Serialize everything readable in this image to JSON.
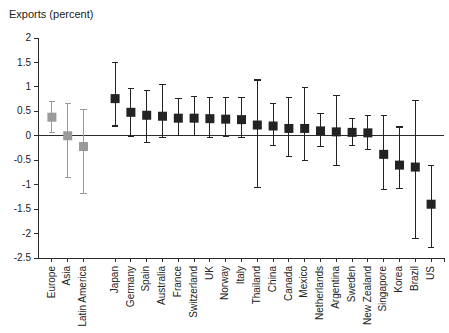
{
  "chart_data": {
    "type": "scatter",
    "title": "Exports (percent)",
    "xlabel": "",
    "ylabel": "",
    "ylim": [
      -2.5,
      2
    ],
    "ytick_labels": [
      "2",
      "1.5",
      "1",
      "0.5",
      "0",
      "-0.5",
      "-1",
      "-1.5",
      "-2",
      "-2.5"
    ],
    "ytick_values": [
      2,
      1.5,
      1,
      0.5,
      0,
      -0.5,
      -1,
      -1.5,
      -2,
      -2.5
    ],
    "grid": false,
    "legend": "none",
    "zero_line": true,
    "categories": [
      "Europe",
      "Asia",
      "Latin America",
      "Japan",
      "Germany",
      "Spain",
      "Australia",
      "France",
      "Switzerland",
      "UK",
      "Norway",
      "Italy",
      "Thailand",
      "China",
      "Canada",
      "Mexico",
      "Netherlands",
      "Argentina",
      "Sweden",
      "New Zealand",
      "Singapore",
      "Korea",
      "Brazil",
      "US"
    ],
    "series": [
      {
        "name": "Region aggregates",
        "color": "#9a9a9a",
        "points": [
          {
            "category": "Europe",
            "value": 0.38,
            "low": 0.06,
            "high": 0.7
          },
          {
            "category": "Asia",
            "value": 0.0,
            "low": -0.86,
            "high": 0.66
          },
          {
            "category": "Latin America",
            "value": -0.22,
            "low": -1.18,
            "high": 0.54
          }
        ]
      },
      {
        "name": "Countries",
        "color": "#232323",
        "points": [
          {
            "category": "Japan",
            "value": 0.76,
            "low": 0.2,
            "high": 1.5
          },
          {
            "category": "Germany",
            "value": 0.48,
            "low": -0.02,
            "high": 0.96
          },
          {
            "category": "Spain",
            "value": 0.42,
            "low": -0.14,
            "high": 0.92
          },
          {
            "category": "Australia",
            "value": 0.4,
            "low": -0.04,
            "high": 1.04
          },
          {
            "category": "France",
            "value": 0.36,
            "low": 0.0,
            "high": 0.76
          },
          {
            "category": "Switzerland",
            "value": 0.36,
            "low": 0.0,
            "high": 0.8
          },
          {
            "category": "UK",
            "value": 0.35,
            "low": -0.04,
            "high": 0.78
          },
          {
            "category": "Norway",
            "value": 0.34,
            "low": -0.02,
            "high": 0.78
          },
          {
            "category": "Italy",
            "value": 0.33,
            "low": -0.04,
            "high": 0.78
          },
          {
            "category": "Thailand",
            "value": 0.22,
            "low": -1.06,
            "high": 1.14
          },
          {
            "category": "China",
            "value": 0.2,
            "low": -0.2,
            "high": 0.66
          },
          {
            "category": "Canada",
            "value": 0.15,
            "low": -0.42,
            "high": 0.78
          },
          {
            "category": "Mexico",
            "value": 0.15,
            "low": -0.5,
            "high": 0.98
          },
          {
            "category": "Netherlands",
            "value": 0.1,
            "low": -0.22,
            "high": 0.46
          },
          {
            "category": "Argentina",
            "value": 0.08,
            "low": -0.6,
            "high": 0.82
          },
          {
            "category": "Sweden",
            "value": 0.07,
            "low": -0.2,
            "high": 0.36
          },
          {
            "category": "New Zealand",
            "value": 0.06,
            "low": -0.28,
            "high": 0.42
          },
          {
            "category": "Singapore",
            "value": -0.38,
            "low": -1.1,
            "high": 0.42
          },
          {
            "category": "Korea",
            "value": -0.6,
            "low": -1.08,
            "high": 0.18
          },
          {
            "category": "Brazil",
            "value": -0.64,
            "low": -2.1,
            "high": 0.72
          },
          {
            "category": "US",
            "value": -1.4,
            "low": -2.28,
            "high": -0.6
          }
        ]
      }
    ]
  },
  "colors": {
    "axis": "#2b2b2b",
    "gray_marker": "#9a9a9a",
    "dark_marker": "#232323",
    "background": "#ffffff"
  }
}
